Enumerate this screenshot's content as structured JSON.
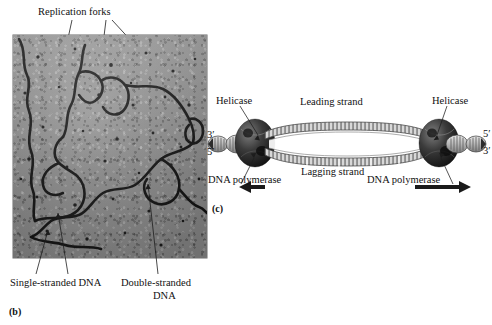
{
  "figure": {
    "panel_b": {
      "tag": "(b)",
      "type": "electron-micrograph",
      "callouts": {
        "replication_forks": "Replication forks",
        "single_stranded_dna": "Single-stranded DNA",
        "double_stranded_dna_line1": "Double-stranded",
        "double_stranded_dna_line2": "DNA"
      }
    },
    "panel_c": {
      "tag": "(c)",
      "type": "replication-bubble-schematic",
      "labels": {
        "helicase_left": "Helicase",
        "helicase_right": "Helicase",
        "leading_strand": "Leading strand",
        "lagging_strand": "Lagging strand",
        "polymerase_left": "DNA polymerase",
        "polymerase_right": "DNA polymerase",
        "left_top_prime": "3′",
        "left_bottom_prime": "5′",
        "right_top_prime": "5′",
        "right_bottom_prime": "3′"
      },
      "arrows": {
        "left_direction": "left",
        "right_direction": "right"
      }
    }
  },
  "colors": {
    "ink": "#111111",
    "micrograph_background": "#9a9a9a",
    "dna_strand": "#141414",
    "helicase_fill": "#2a2a2a",
    "duplex_fill": "#cfcfcf",
    "arrow": "#1a1a1a"
  }
}
